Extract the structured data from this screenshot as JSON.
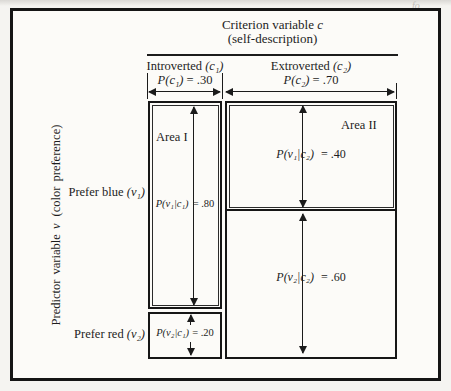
{
  "header": {
    "title": "Criterion variable ",
    "title_var": "c",
    "subtitle": "(self-description)"
  },
  "columns": {
    "introverted": {
      "name": "Introverted ",
      "var": "(c₁)",
      "p_math": "P(c₁)",
      "p_eq": "= .30"
    },
    "extroverted": {
      "name": "Extroverted ",
      "var": "(c₂)",
      "p_math": "P(c₂)",
      "p_eq": "= .70"
    }
  },
  "rows": {
    "blue": {
      "name": "Prefer blue ",
      "var": "(v₁)"
    },
    "red": {
      "name": "Prefer red ",
      "var": "(v₂)"
    }
  },
  "axis": {
    "a": "Predictor variable ",
    "var": "v",
    "b": "(color preference)"
  },
  "areas": {
    "area1": {
      "label": "Area I",
      "p_math": "P(v₁|c₁)",
      "p_eq": "= .80"
    },
    "area2": {
      "label": "Area II",
      "p_math": "P(v₁|c₂)",
      "p_eq": "= .40"
    },
    "red_intro": {
      "p_math": "P(v₂|c₁)",
      "p_eq": "= .20"
    },
    "red_extro": {
      "p_math": "P(v₂|c₂)",
      "p_eq": "= .60"
    }
  },
  "probabilities": {
    "P(c1)": 0.3,
    "P(c2)": 0.7,
    "P(v1|c1)": 0.8,
    "P(v2|c1)": 0.2,
    "P(v1|c2)": 0.4,
    "P(v2|c2)": 0.6
  },
  "artifact": "fo",
  "colors": {
    "ink": "#1b1b1b",
    "paper": "#fcfbf8",
    "page_bg": "#f5f4f1"
  }
}
